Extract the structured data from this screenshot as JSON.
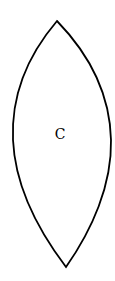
{
  "diagram": {
    "type": "lens-shape",
    "label": "C",
    "stroke_color": "#000000",
    "fill_color": "#ffffff",
    "background_color": "#ffffff"
  }
}
